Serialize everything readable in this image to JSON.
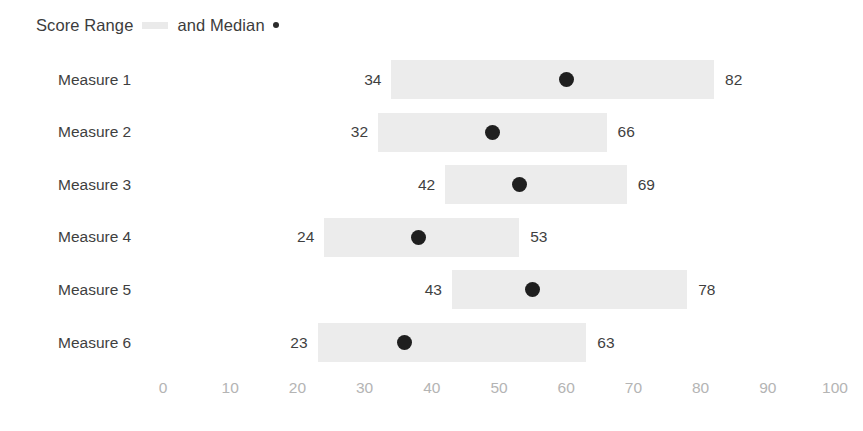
{
  "legend": {
    "range_label": "Score Range",
    "range_swatch": "range-bar-swatch",
    "median_label": "and Median",
    "median_swatch": "median-dot-swatch"
  },
  "chart_data": {
    "type": "bar",
    "subtype": "range-bar-with-median-dot",
    "title": "Score Range and Median",
    "xlabel": "",
    "ylabel": "",
    "xlim": [
      0,
      100
    ],
    "grid": false,
    "legend_position": "top-left",
    "categories": [
      "Measure 1",
      "Measure 2",
      "Measure 3",
      "Measure 4",
      "Measure 5",
      "Measure 6"
    ],
    "series": [
      {
        "name": "Score Range",
        "low": [
          34,
          32,
          42,
          24,
          43,
          23
        ],
        "high": [
          82,
          66,
          69,
          53,
          78,
          63
        ]
      },
      {
        "name": "Median",
        "values": [
          60,
          49,
          53,
          38,
          55,
          36
        ]
      }
    ],
    "rows": [
      {
        "label": "Measure 1",
        "low": 34,
        "high": 82,
        "median": 60,
        "low_text": "34",
        "high_text": "82"
      },
      {
        "label": "Measure 2",
        "low": 32,
        "high": 66,
        "median": 49,
        "low_text": "32",
        "high_text": "66"
      },
      {
        "label": "Measure 3",
        "low": 42,
        "high": 69,
        "median": 53,
        "low_text": "42",
        "high_text": "69"
      },
      {
        "label": "Measure 4",
        "low": 24,
        "high": 53,
        "median": 38,
        "low_text": "24",
        "high_text": "53"
      },
      {
        "label": "Measure 5",
        "low": 43,
        "high": 78,
        "median": 55,
        "low_text": "43",
        "high_text": "78"
      },
      {
        "label": "Measure 6",
        "low": 23,
        "high": 63,
        "median": 36,
        "low_text": "23",
        "high_text": "63"
      }
    ],
    "xticks": [
      0,
      10,
      20,
      30,
      40,
      50,
      60,
      70,
      80,
      90,
      100
    ],
    "xtick_labels": [
      "0",
      "10",
      "20",
      "30",
      "40",
      "50",
      "60",
      "70",
      "80",
      "90",
      "100"
    ],
    "colors": {
      "range_bar": "#ececec",
      "median_dot": "#1f1f1f",
      "label_text": "#3f3f3f",
      "tick_text": "#b4b4b4",
      "background": "#ffffff"
    }
  },
  "axis": {
    "origin_px": 163,
    "px_per_unit": 6.72,
    "row_top_px": 60,
    "row_pitch_px": 52.6,
    "row_height_px": 39
  }
}
